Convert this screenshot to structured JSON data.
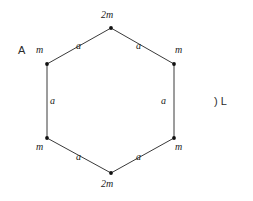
{
  "figure": {
    "background_color": "#ffffff",
    "line_color": "#3a3a3a",
    "vertex_color": "#111111",
    "text_color": "#1a1a1a",
    "shape": "hexagon"
  },
  "annotations": {
    "left_marker": "A",
    "right_marker": ") L"
  },
  "vertices": [
    {
      "id": "top",
      "label": "2m",
      "x": 111,
      "y": 28,
      "label_x": 101,
      "label_y": 10
    },
    {
      "id": "top-right",
      "label": "m",
      "x": 174,
      "y": 64,
      "label_x": 175,
      "label_y": 45
    },
    {
      "id": "bottom-right",
      "label": "m",
      "x": 174,
      "y": 138,
      "label_x": 175,
      "label_y": 142
    },
    {
      "id": "bottom",
      "label": "2m",
      "x": 111,
      "y": 173,
      "label_x": 101,
      "label_y": 179
    },
    {
      "id": "bottom-left",
      "label": "m",
      "x": 47,
      "y": 138,
      "label_x": 36,
      "label_y": 142
    },
    {
      "id": "top-left",
      "label": "m",
      "x": 47,
      "y": 64,
      "label_x": 36,
      "label_y": 45
    }
  ],
  "edges": [
    {
      "id": "edge-top-left",
      "label": "a",
      "label_x": 76,
      "label_y": 41
    },
    {
      "id": "edge-top-right",
      "label": "a",
      "label_x": 136,
      "label_y": 41
    },
    {
      "id": "edge-right",
      "label": "a",
      "label_x": 161,
      "label_y": 96
    },
    {
      "id": "edge-bottom-right",
      "label": "a",
      "label_x": 136,
      "label_y": 152
    },
    {
      "id": "edge-bottom-left",
      "label": "a",
      "label_x": 76,
      "label_y": 152
    },
    {
      "id": "edge-left",
      "label": "a",
      "label_x": 50,
      "label_y": 96
    }
  ]
}
